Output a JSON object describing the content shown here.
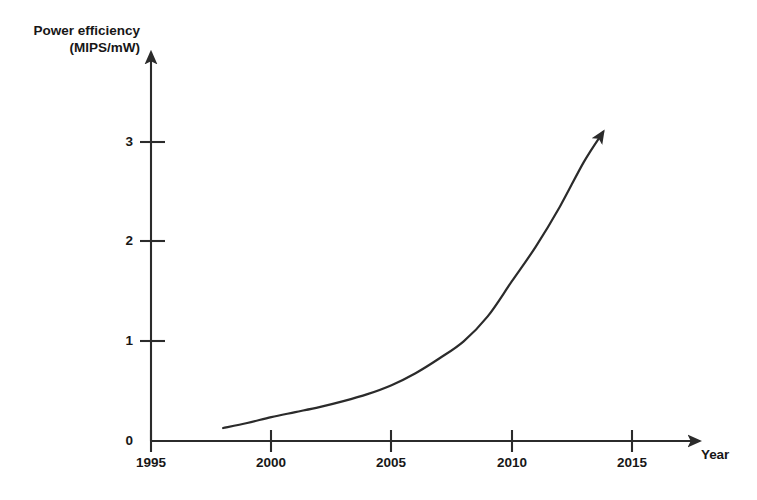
{
  "chart_data": {
    "type": "line",
    "title": "",
    "subtitle": "",
    "ylabel_line1": "Power efficiency",
    "ylabel_line2": "(MIPS/mW)",
    "ylabel": "Power efficiency (MIPS/mW)",
    "xlabel": "Year",
    "xlim": [
      1995,
      2017.5
    ],
    "ylim": [
      0,
      3.5
    ],
    "xticks": [
      1995,
      2000,
      2005,
      2010,
      2015
    ],
    "xtick_labels": [
      "1995",
      "2000",
      "2005",
      "2010",
      "2015"
    ],
    "yticks": [
      0,
      1,
      2,
      3
    ],
    "ytick_labels": [
      "0",
      "1",
      "2",
      "3"
    ],
    "grid": false,
    "legend": null,
    "legend_position": "none",
    "axis_arrows": true,
    "curve_arrow_head": true,
    "series": [
      {
        "name": "Power efficiency",
        "x": [
          1998.0,
          1999.0,
          2000.0,
          2001.0,
          2002.0,
          2003.0,
          2004.0,
          2005.0,
          2006.0,
          2007.0,
          2008.0,
          2009.0,
          2010.0,
          2011.0,
          2012.0,
          2013.0,
          2013.8
        ],
        "values": [
          0.13,
          0.18,
          0.24,
          0.29,
          0.34,
          0.4,
          0.47,
          0.56,
          0.68,
          0.83,
          1.0,
          1.25,
          1.6,
          1.95,
          2.35,
          2.8,
          3.1
        ]
      }
    ],
    "annotations": [],
    "colors": {
      "background": "#ffffff",
      "axis": "#2b2b2b",
      "curve": "#2b2b2b",
      "text": "#171717"
    }
  },
  "figure": {
    "ylabel_line1": "Power efficiency",
    "ylabel_line2": "(MIPS/mW)",
    "xlabel": "Year",
    "xtick_labels": [
      "1995",
      "2000",
      "2005",
      "2010",
      "2015"
    ],
    "ytick_labels": [
      "0",
      "1",
      "2",
      "3"
    ]
  }
}
